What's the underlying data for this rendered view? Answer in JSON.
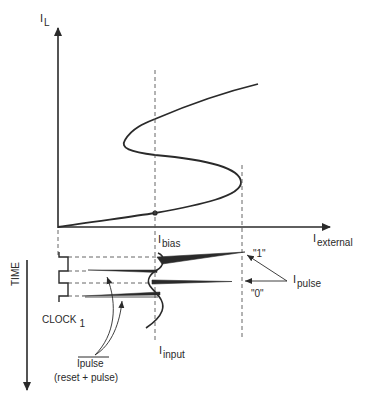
{
  "diagram": {
    "axes": {
      "y_axis": {
        "main": "I",
        "sub": "L"
      },
      "x_axis": {
        "main": "I",
        "sub": "external"
      },
      "time_axis": "TIME"
    },
    "labels": {
      "ibias": {
        "main": "I",
        "sub": "bias"
      },
      "iinput": {
        "main": "I",
        "sub": "input"
      },
      "ipulse_right": {
        "main": "I",
        "sub": "pulse"
      },
      "one": "\"1\"",
      "zero": "\"0\"",
      "clock": {
        "main": "CLOCK",
        "sub": "1"
      },
      "ipulse_bottom": "Ipulse",
      "reset_pulse": "(reset + pulse)"
    },
    "colors": {
      "line": "#2a2a2a",
      "dashed": "#555555",
      "background": "#ffffff"
    }
  }
}
